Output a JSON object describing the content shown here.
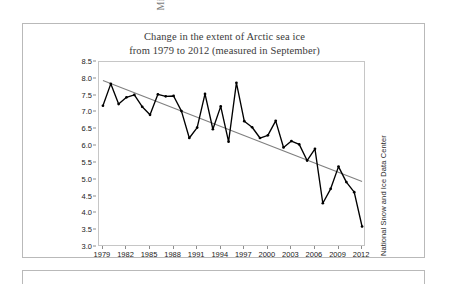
{
  "figure": {
    "title_line1": "Change in the extent of Arctic sea ice",
    "title_line2": "from 1979 to 2012 (measured in September)",
    "source_credit": "National Snow and Ice Data Center",
    "y_axis_title": "Million km",
    "y_axis_title_exponent": "2",
    "frame_color": "#b9b9b9",
    "series_color": "#000000",
    "trend_color": "#7f7f7f",
    "title_color": "#3a3a3a"
  },
  "chart_data": {
    "type": "line",
    "title": "Change in the extent of Arctic sea ice from 1979 to 2012 (measured in September)",
    "xlabel": "",
    "ylabel": "Million km2",
    "xlim": [
      1978.5,
      2012.5
    ],
    "ylim": [
      3.0,
      8.5
    ],
    "grid": false,
    "legend": "none",
    "y_ticks": [
      "8.5",
      "8.0",
      "7.5",
      "7.0",
      "6.5",
      "6.0",
      "5.5",
      "5.0",
      "4.5",
      "4.0",
      "3.5",
      "3.0"
    ],
    "y_tick_values": [
      8.5,
      8.0,
      7.5,
      7.0,
      6.5,
      6.0,
      5.5,
      5.0,
      4.5,
      4.0,
      3.5,
      3.0
    ],
    "x_ticks": [
      "1979",
      "1982",
      "1985",
      "1988",
      "1991",
      "1994",
      "1997",
      "2000",
      "2003",
      "2006",
      "2009",
      "2012"
    ],
    "x_tick_values": [
      1979,
      1982,
      1985,
      1988,
      1991,
      1994,
      1997,
      2000,
      2003,
      2006,
      2009,
      2012
    ],
    "x": [
      1979,
      1980,
      1981,
      1982,
      1983,
      1984,
      1985,
      1986,
      1987,
      1988,
      1989,
      1990,
      1991,
      1992,
      1993,
      1994,
      1995,
      1996,
      1997,
      1998,
      1999,
      2000,
      2001,
      2002,
      2003,
      2004,
      2005,
      2006,
      2007,
      2008,
      2009,
      2010,
      2011,
      2012
    ],
    "series": [
      {
        "name": "Arctic sea ice extent",
        "marker": "dot",
        "values": [
          7.2,
          7.85,
          7.25,
          7.45,
          7.52,
          7.17,
          6.93,
          7.54,
          7.48,
          7.49,
          7.04,
          6.24,
          6.55,
          7.55,
          6.5,
          7.18,
          6.13,
          7.88,
          6.74,
          6.56,
          6.24,
          6.32,
          6.75,
          5.96,
          6.15,
          6.05,
          5.57,
          5.92,
          4.3,
          4.73,
          5.39,
          4.93,
          4.63,
          3.61
        ]
      }
    ],
    "trendline": {
      "name": "Linear trend",
      "x_start": 1979,
      "x_end": 2012,
      "y_start": 7.95,
      "y_end": 4.95,
      "color": "#7f7f7f"
    }
  }
}
